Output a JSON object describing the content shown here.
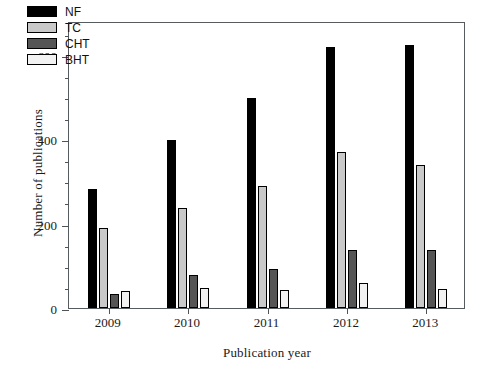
{
  "chart_data": {
    "type": "bar",
    "title": "",
    "xlabel": "Publication year",
    "ylabel": "Number of publications",
    "categories": [
      "2009",
      "2010",
      "2011",
      "2012",
      "2013"
    ],
    "series": [
      {
        "name": "NF",
        "color": "#000000",
        "values": [
          282,
          398,
          498,
          618,
          623
        ]
      },
      {
        "name": "TC",
        "color": "#c9c9c9",
        "values": [
          190,
          238,
          288,
          370,
          340
        ]
      },
      {
        "name": "CHT",
        "color": "#555555",
        "values": [
          33,
          78,
          92,
          137,
          138
        ]
      },
      {
        "name": "BHT",
        "color": "#f2f2f2",
        "values": [
          41,
          48,
          43,
          59,
          45
        ]
      }
    ],
    "ylim": [
      0,
      680
    ],
    "yticks": [
      0,
      200,
      400,
      600
    ],
    "ytick_labels": [
      "0",
      "200",
      "400",
      "600"
    ],
    "yminor_step": 50,
    "grid": false,
    "legend_position": "top-left",
    "legend_entries": [
      "NF",
      "TC",
      "CHT",
      "BHT"
    ]
  },
  "axes": {
    "y_title": "Number of publications",
    "x_title": "Publication year"
  }
}
